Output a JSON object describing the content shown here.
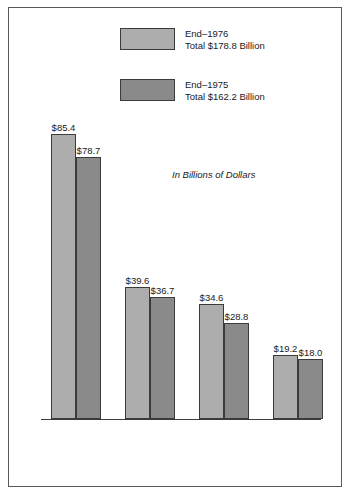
{
  "annotation": "In Billions of Dollars",
  "legend": [
    {
      "label": "End–1976",
      "total": "Total $178.8 Billion",
      "color": "#adadad"
    },
    {
      "label": "End–1975",
      "total": "Total $162.2 Billion",
      "color": "#8a8a8a"
    }
  ],
  "chart_data": {
    "type": "bar",
    "title": "",
    "subtitle": "",
    "annotation": "In Billions of Dollars",
    "xlabel": "",
    "ylabel": "",
    "ylim": [
      0,
      90
    ],
    "grid": false,
    "legend_position": "top-center",
    "value_prefix": "$",
    "categories": [
      "Commercial Banks",
      "Finance Companies",
      "Other Financial Lenders",
      "Retail Outlets"
    ],
    "category_lines": [
      [
        "Commercial",
        "Banks"
      ],
      [
        "Finance",
        "Companies"
      ],
      [
        "Other",
        "Financial",
        "Lenders"
      ],
      [
        "Retail",
        "Outlets"
      ]
    ],
    "series": [
      {
        "name": "End–1976",
        "total": 178.8,
        "color": "#adadad",
        "values": [
          85.4,
          39.6,
          34.6,
          19.2
        ],
        "labels": [
          "$85.4",
          "$39.6",
          "$34.6",
          "$19.2"
        ]
      },
      {
        "name": "End–1975",
        "total": 162.2,
        "color": "#8a8a8a",
        "values": [
          78.7,
          36.7,
          28.8,
          18.0
        ],
        "labels": [
          "$78.7",
          "$36.7",
          "$28.8",
          "$18.0"
        ]
      }
    ]
  }
}
